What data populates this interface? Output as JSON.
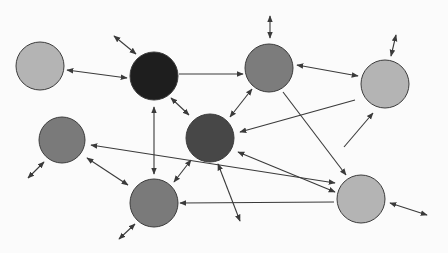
{
  "diagram": {
    "type": "network-graph",
    "background": "#fbfbfb",
    "edge_color": "#3a3a3a",
    "nodes": [
      {
        "id": "n1",
        "x": 40,
        "y": 66,
        "r": 24,
        "fill": "#b4b4b4"
      },
      {
        "id": "n2",
        "x": 154,
        "y": 76,
        "r": 24,
        "fill": "#1e1e1e"
      },
      {
        "id": "n3",
        "x": 269,
        "y": 68,
        "r": 24,
        "fill": "#7c7c7c"
      },
      {
        "id": "n4",
        "x": 385,
        "y": 84,
        "r": 24,
        "fill": "#b4b4b4"
      },
      {
        "id": "n5",
        "x": 62,
        "y": 140,
        "r": 23,
        "fill": "#7a7a7a"
      },
      {
        "id": "n6",
        "x": 210,
        "y": 138,
        "r": 24,
        "fill": "#474747"
      },
      {
        "id": "n7",
        "x": 154,
        "y": 203,
        "r": 24,
        "fill": "#7a7a7a"
      },
      {
        "id": "n8",
        "x": 361,
        "y": 199,
        "r": 24,
        "fill": "#b4b4b4"
      }
    ],
    "edges": [
      {
        "x1": 67,
        "y1": 70,
        "x2": 127,
        "y2": 78,
        "start": true,
        "end": true
      },
      {
        "x1": 114,
        "y1": 36,
        "x2": 136,
        "y2": 54,
        "start": true,
        "end": true
      },
      {
        "x1": 179,
        "y1": 74,
        "x2": 243,
        "y2": 74,
        "start": false,
        "end": true
      },
      {
        "x1": 270,
        "y1": 16,
        "x2": 270,
        "y2": 38,
        "start": true,
        "end": true
      },
      {
        "x1": 297,
        "y1": 65,
        "x2": 358,
        "y2": 76,
        "start": true,
        "end": true
      },
      {
        "x1": 396,
        "y1": 35,
        "x2": 391,
        "y2": 56,
        "start": true,
        "end": true
      },
      {
        "x1": 171,
        "y1": 98,
        "x2": 189,
        "y2": 115,
        "start": true,
        "end": true
      },
      {
        "x1": 154,
        "y1": 107,
        "x2": 154,
        "y2": 174,
        "start": true,
        "end": true
      },
      {
        "x1": 252,
        "y1": 89,
        "x2": 230,
        "y2": 117,
        "start": true,
        "end": true
      },
      {
        "x1": 373,
        "y1": 113,
        "x2": 344,
        "y2": 147,
        "start": true,
        "end": false
      },
      {
        "x1": 355,
        "y1": 100,
        "x2": 240,
        "y2": 132,
        "start": false,
        "end": true
      },
      {
        "x1": 283,
        "y1": 92,
        "x2": 346,
        "y2": 175,
        "start": false,
        "end": true
      },
      {
        "x1": 335,
        "y1": 183,
        "x2": 91,
        "y2": 145,
        "start": true,
        "end": true
      },
      {
        "x1": 335,
        "y1": 192,
        "x2": 238,
        "y2": 152,
        "start": true,
        "end": true
      },
      {
        "x1": 180,
        "y1": 203,
        "x2": 334,
        "y2": 202,
        "start": true,
        "end": false
      },
      {
        "x1": 218,
        "y1": 164,
        "x2": 240,
        "y2": 221,
        "start": true,
        "end": true
      },
      {
        "x1": 191,
        "y1": 160,
        "x2": 174,
        "y2": 182,
        "start": true,
        "end": true
      },
      {
        "x1": 87,
        "y1": 158,
        "x2": 128,
        "y2": 185,
        "start": true,
        "end": true
      },
      {
        "x1": 44,
        "y1": 162,
        "x2": 28,
        "y2": 178,
        "start": true,
        "end": true
      },
      {
        "x1": 135,
        "y1": 224,
        "x2": 119,
        "y2": 239,
        "start": true,
        "end": true
      },
      {
        "x1": 390,
        "y1": 203,
        "x2": 427,
        "y2": 215,
        "start": true,
        "end": true
      },
      {
        "x1": 224,
        "y1": 118,
        "x2": 225,
        "y2": 118,
        "start": false,
        "end": false
      }
    ]
  }
}
